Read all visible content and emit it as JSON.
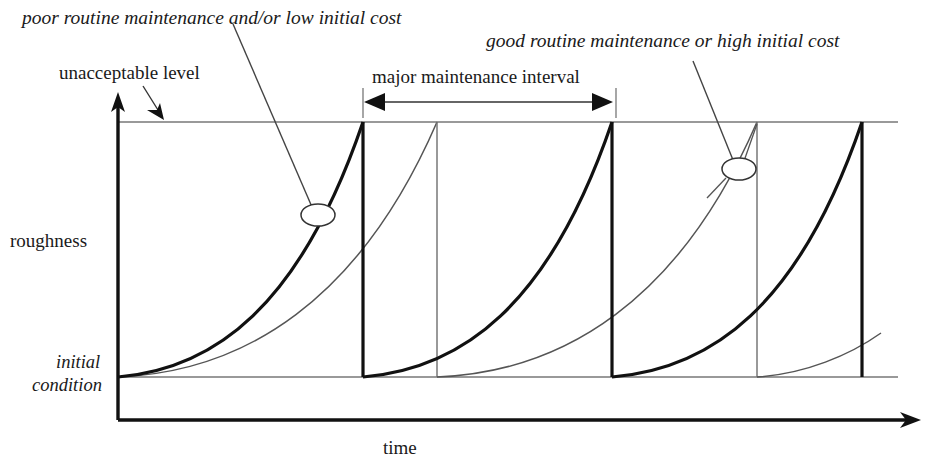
{
  "diagram": {
    "type": "line",
    "labels": {
      "poor_maintenance": "poor routine maintenance and/or low initial cost",
      "good_maintenance": "good routine maintenance or high initial cost",
      "unacceptable_level": "unacceptable level",
      "major_interval": "major maintenance interval",
      "y_axis": "roughness",
      "initial_line1": "initial",
      "initial_line2": "condition",
      "x_axis": "time"
    },
    "colors": {
      "bold_curve": "#111111",
      "thin_curve": "#555555",
      "axis": "#111111",
      "guide_line": "#777777",
      "leader": "#444444",
      "background": "#ffffff"
    },
    "axes": {
      "y_label": "roughness",
      "x_label": "time",
      "y_origin_px": 377,
      "unacceptable_level_px": 122,
      "x_axis_px": 420,
      "origin_x_px": 118,
      "x_end_px": 920
    },
    "series": [
      {
        "name": "poor routine maintenance and/or low initial cost",
        "style": "bold",
        "description": "Roughness rises rapidly from initial condition to the unacceptable level, then is reset by major maintenance.",
        "cycle_start_x_px": [
          118,
          363,
          612,
          757
        ],
        "cycle_peak_x_px": [
          363,
          612,
          862
        ],
        "cycles": 3,
        "interval_px": 249
      },
      {
        "name": "good routine maintenance or high initial cost",
        "style": "thin",
        "description": "Roughness rises slowly from initial condition, reaching the unacceptable level after a longer interval.",
        "cycle_start_x_px": [
          118,
          437,
          757
        ],
        "cycle_peak_x_px": [
          437,
          757
        ],
        "cycles": 2,
        "interval_px": 319
      }
    ],
    "annotations": [
      {
        "name": "unacceptable-level-pointer",
        "text": "unacceptable level",
        "from_px": [
          145,
          90
        ],
        "to_px": [
          160,
          114
        ]
      },
      {
        "name": "major-maintenance-interval",
        "text": "major maintenance interval",
        "span_start_px": 363,
        "span_end_px": 613,
        "y_px": 102
      },
      {
        "name": "poor-maintenance-callout",
        "text": "poor routine maintenance and/or low initial cost",
        "leader_from_px": [
          233,
          24
        ],
        "marker_px": [
          317,
          214
        ],
        "marker_shape": "ellipse"
      },
      {
        "name": "good-maintenance-callout",
        "text": "good routine maintenance or high initial cost",
        "leader_from_px": [
          693,
          61
        ],
        "marker_px": [
          739,
          169
        ],
        "marker_shape": "ellipse"
      }
    ]
  }
}
